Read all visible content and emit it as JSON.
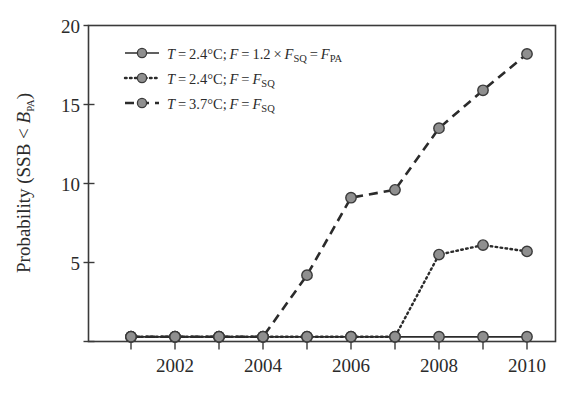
{
  "chart_data": {
    "type": "line",
    "title": "",
    "xlabel": "",
    "ylabel": "Probability (SSB < B_PA)",
    "x": [
      2001,
      2002,
      2003,
      2004,
      2005,
      2006,
      2007,
      2008,
      2009,
      2010
    ],
    "xtick_labels": [
      "2002",
      "2004",
      "2006",
      "2008",
      "2010"
    ],
    "xtick_values": [
      2002,
      2004,
      2006,
      2008,
      2010
    ],
    "ytick_labels": [
      "5",
      "10",
      "15",
      "20"
    ],
    "ytick_values": [
      5,
      10,
      15,
      20
    ],
    "xlim": [
      2000.6,
      2010.6
    ],
    "ylim": [
      0,
      20
    ],
    "grid": false,
    "legend_position": "upper left",
    "series": [
      {
        "name": "T = 2.4°C; F = 1.2 × F_SQ = F_PA",
        "style": "solid",
        "values": [
          0.3,
          0.3,
          0.3,
          0.3,
          0.3,
          0.3,
          0.3,
          0.3,
          0.3,
          0.3
        ]
      },
      {
        "name": "T = 2.4°C; F = F_SQ",
        "style": "dotted",
        "values": [
          0.3,
          0.3,
          0.3,
          0.3,
          0.3,
          0.3,
          0.3,
          5.5,
          6.1,
          5.7
        ]
      },
      {
        "name": "T = 3.7°C; F = F_SQ",
        "style": "dashed",
        "values": [
          0.3,
          0.3,
          0.3,
          0.3,
          4.2,
          9.1,
          9.6,
          13.5,
          15.9,
          18.2
        ]
      }
    ]
  },
  "axis": {
    "ylabel_parts": {
      "prefix": "Probability (SSB < ",
      "italic_symbol": "B",
      "subscript": "PA",
      "suffix": ")"
    }
  },
  "legend": {
    "entries": [
      {
        "marker": "line-marker-solid",
        "t_symbol": "T",
        "t_eq": " = 2.4°C; ",
        "f_symbol": "F",
        "f_eq": " = 1.2 × ",
        "f2_symbol": "F",
        "f2_sub": "SQ",
        "f3_eq": " = ",
        "f3_symbol": "F",
        "f3_sub": "PA"
      },
      {
        "marker": "line-marker-dotted",
        "t_symbol": "T",
        "t_eq": " = 2.4°C; ",
        "f_symbol": "F",
        "f_eq": " = ",
        "f2_symbol": "F",
        "f2_sub": "SQ"
      },
      {
        "marker": "line-marker-dashed",
        "t_symbol": "T",
        "t_eq": " = 3.7°C; ",
        "f_symbol": "F",
        "f_eq": " = ",
        "f2_symbol": "F",
        "f2_sub": "SQ"
      }
    ]
  },
  "colors": {
    "axis": "#3a3a3a",
    "line": "#2b2b2b",
    "marker_fill": "#8f8f8f",
    "marker_stroke": "#3a3a3a",
    "text": "#2b2b2b"
  }
}
